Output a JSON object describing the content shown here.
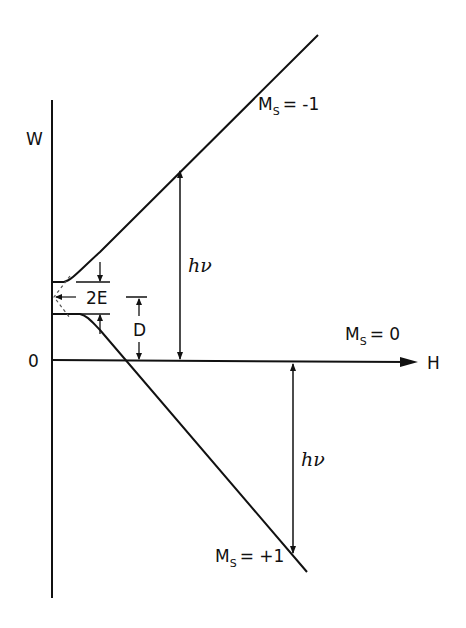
{
  "diagram": {
    "axes": {
      "y_label": "W",
      "x_label": "H",
      "origin_label": "0"
    },
    "levels": [
      {
        "id": "ms-minus1",
        "label_main": "M",
        "label_sub": "S",
        "label_value": "= -1"
      },
      {
        "id": "ms-0",
        "label_main": "M",
        "label_sub": "S",
        "label_value": "= 0"
      },
      {
        "id": "ms-plus1",
        "label_main": "M",
        "label_sub": "S",
        "label_value": "= +1"
      }
    ],
    "annotations": {
      "splitting_2e": "2E",
      "splitting_d": "D",
      "transition_upper": "hν",
      "transition_lower": "hν"
    },
    "colors": {
      "ink": "#111111",
      "background": "#ffffff"
    }
  }
}
